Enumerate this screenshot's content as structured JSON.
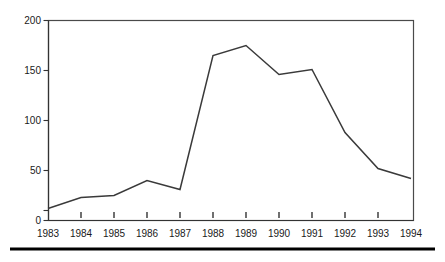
{
  "chart_data": {
    "type": "line",
    "title": "",
    "xlabel": "",
    "ylabel": "",
    "x": [
      1983,
      1984,
      1985,
      1986,
      1987,
      1988,
      1989,
      1990,
      1991,
      1992,
      1993,
      1994
    ],
    "values": [
      12,
      23,
      25,
      40,
      31,
      165,
      175,
      146,
      151,
      88,
      52,
      42
    ],
    "series": [
      {
        "name": "",
        "values": [
          12,
          23,
          25,
          40,
          31,
          165,
          175,
          146,
          151,
          88,
          52,
          42
        ]
      }
    ],
    "xlim": [
      1983,
      1994
    ],
    "ylim": [
      0,
      200
    ],
    "grid": false,
    "legend": "none",
    "x_tick_labels": [
      "1983",
      "1984",
      "1985",
      "1986",
      "1987",
      "1988",
      "1989",
      "1990",
      "1991",
      "1992",
      "1993",
      "1994"
    ],
    "y_tick_labels": [
      "0",
      "50",
      "100",
      "150",
      "200"
    ],
    "y_ticks": [
      0,
      50,
      100,
      150,
      200
    ],
    "line_color": "#3a3a3a",
    "axis_color": "#333333",
    "frame_color": "#4a4a4a",
    "background_color": "#ffffff",
    "text_color": "#1a1a1a"
  }
}
